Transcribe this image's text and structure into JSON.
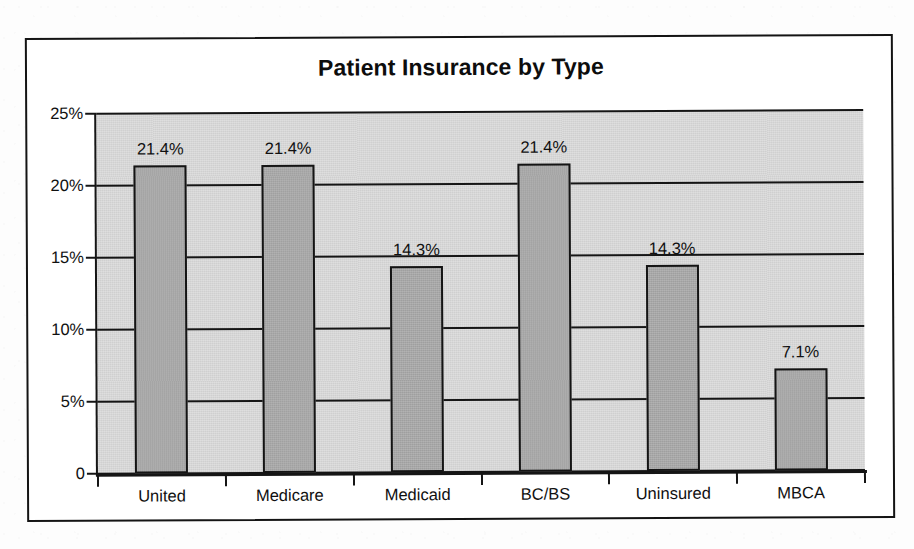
{
  "document": {
    "type": "scanned-figure",
    "background_color": "#fdfdfd",
    "frame_color": "#141414"
  },
  "chart_data": {
    "type": "bar",
    "title": "Patient Insurance by Type",
    "xlabel": "",
    "ylabel": "",
    "categories": [
      "United",
      "Medicare",
      "Medicaid",
      "BC/BS",
      "Uninsured",
      "MBCA"
    ],
    "values": [
      21.4,
      21.4,
      14.3,
      21.4,
      14.3,
      7.1
    ],
    "value_labels": [
      "21.4%",
      "21.4%",
      "14.3%",
      "21.4%",
      "14.3%",
      "7.1%"
    ],
    "ylim": [
      0,
      25
    ],
    "ytick_values": [
      25,
      20,
      15,
      10,
      5,
      0
    ],
    "ytick_labels": [
      "25%",
      "20%",
      "15%",
      "10%",
      "5%",
      "0"
    ],
    "grid": true,
    "grid_axis": "y",
    "legend": false,
    "legend_position": "none",
    "bar_fill_color": "#a6a6a6",
    "bar_edge_color": "#141414",
    "plot_background_color": "#d7d7d7",
    "axis_color": "#151515"
  }
}
